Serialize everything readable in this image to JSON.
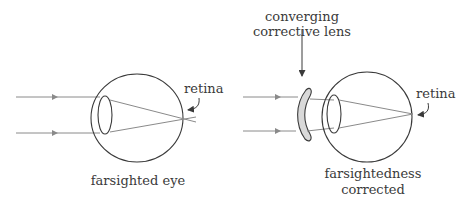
{
  "diagram": {
    "left_panel": {
      "caption": "farsighted eye",
      "retina_label": "retina"
    },
    "right_panel": {
      "lens_label_line1": "converging",
      "lens_label_line2": "corrective lens",
      "retina_label": "retina",
      "caption_line1": "farsightedness",
      "caption_line2": "corrected"
    },
    "colors": {
      "outline": "#3a3a3a",
      "ray": "#8a8a8a",
      "lens_fill": "#d9d9d9"
    }
  }
}
